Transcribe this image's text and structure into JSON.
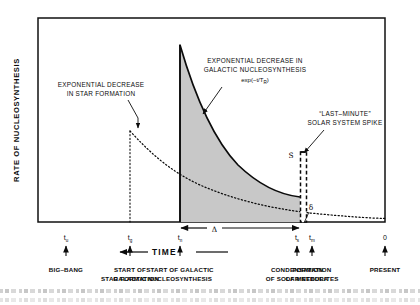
{
  "figure": {
    "y_axis_label": "RATE OF NUCLEOSYNTHESIS",
    "time_axis_label": "TIME",
    "annotations": {
      "star_formation": {
        "line1": "EXPONENTIAL DECREASE",
        "line2": "IN STAR FORMATION"
      },
      "galactic_nucleosynthesis": {
        "line1": "EXPONENTIAL DECREASE IN",
        "line2": "GALACTIC NUCLEOSYNTHESIS",
        "formula_prefix": "exp(−t/T",
        "formula_sub": "R",
        "formula_suffix": ")"
      },
      "solar_spike": {
        "line1": "“LAST–MINUTE”",
        "line2": "SOLAR SYSTEM SPIKE"
      }
    },
    "symbols": {
      "spike_height": "S",
      "spike_width": "δ",
      "interval": "Δ"
    },
    "ticks": [
      {
        "base": "t",
        "sub": "u",
        "x": 66,
        "category_line1": "BIG–BANG",
        "category_line2": ""
      },
      {
        "base": "t",
        "sub": "g",
        "x": 130,
        "category_line1": "START OF",
        "category_line2": "STAR  FORMATION"
      },
      {
        "base": "t",
        "sub": "n",
        "x": 180,
        "category_line1": "START OF GALACTIC",
        "category_line2": "NUCLEOSYNTHESIS"
      },
      {
        "base": "t",
        "sub": "s",
        "x": 297,
        "category_line1": "CONDENSATION",
        "category_line2": "OF SOLAR NEBULA"
      },
      {
        "base": "t",
        "sub": "m",
        "x": 312,
        "category_line1": "FORMATION",
        "category_line2": "OF METEORITES"
      },
      {
        "base": "0",
        "sub": "",
        "x": 385,
        "category_line1": "PRESENT",
        "category_line2": ""
      }
    ],
    "extra_category": "GALACTIC",
    "colors": {
      "ink": "#0b0b0b",
      "shade_fill": "#c8c8c8",
      "frame": "#111111",
      "background": "#ffffff"
    }
  },
  "chart_data": {
    "type": "area",
    "title": "",
    "xlabel": "TIME",
    "ylabel": "RATE OF NUCLEOSYNTHESIS",
    "grid": false,
    "legend": "none",
    "axis_ranges": {
      "x_ticks": [
        "t_u",
        "t_g",
        "t_n",
        "t_s",
        "t_m",
        "0"
      ],
      "y_ticks": []
    },
    "series": [
      {
        "name": "Galactic nucleosynthesis (shaded, exp(-t/T_R))",
        "type": "area",
        "style": "solid-filled",
        "x": [
          180,
          192,
          205,
          218,
          232,
          246,
          261,
          276,
          292,
          297
        ],
        "y": [
          45,
          85,
          113,
          133,
          150,
          163,
          175,
          185,
          193,
          195
        ]
      },
      {
        "name": "Star formation (dotted, exponential decrease)",
        "type": "line",
        "style": "dotted",
        "x": [
          130,
          140,
          152,
          166,
          182,
          200,
          222,
          248,
          275,
          300,
          330,
          360,
          385
        ],
        "y": [
          128,
          140,
          152,
          163,
          173,
          182,
          190,
          198,
          204,
          208,
          212,
          215,
          217
        ]
      },
      {
        "name": "Last-minute solar system spike",
        "type": "bar",
        "style": "dashed-outline",
        "x": [
          300
        ],
        "y_top": 152,
        "y_bottom": 222,
        "width": 6
      }
    ],
    "annotations": [
      {
        "text": "EXPONENTIAL DECREASE IN STAR FORMATION",
        "points_to": [
          168,
          135
        ]
      },
      {
        "text": "EXPONENTIAL DECREASE IN GALACTIC NUCLEOSYNTHESIS exp(-t/T_R)",
        "points_to": [
          207,
          117
        ]
      },
      {
        "text": "\"LAST-MINUTE\" SOLAR SYSTEM SPIKE",
        "points_to": [
          299,
          155
        ]
      },
      {
        "text": "S",
        "points_to": [
          299,
          160
        ]
      },
      {
        "text": "δ",
        "points_to": [
          303,
          222
        ]
      },
      {
        "text": "Δ",
        "span": [
          180,
          297
        ]
      }
    ]
  }
}
